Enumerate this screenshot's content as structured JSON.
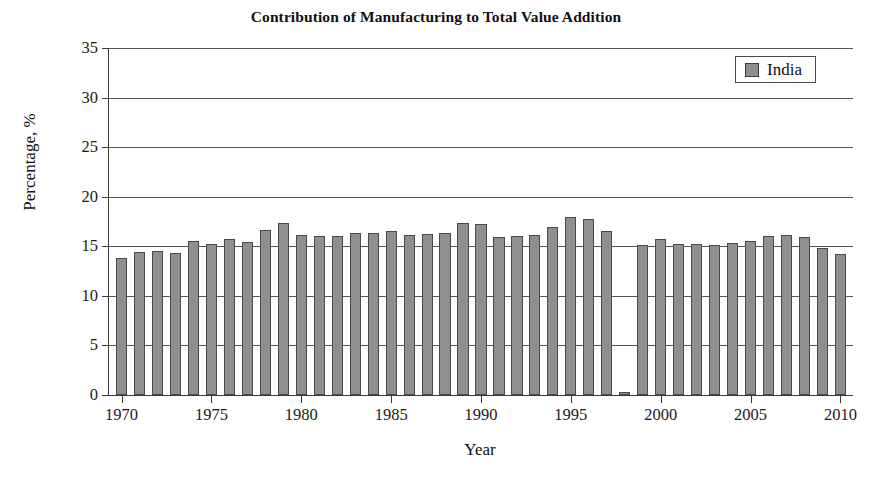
{
  "chart_data": {
    "type": "bar",
    "title": "Contribution of Manufacturing to Total Value Addition",
    "xlabel": "Year",
    "ylabel": "Percentage, %",
    "legend": [
      {
        "name": "India",
        "color": "#8f8f8f"
      }
    ],
    "legend_position": "top-right",
    "grid": true,
    "ylim": [
      0,
      35
    ],
    "yticks": [
      0,
      5,
      10,
      15,
      20,
      25,
      30,
      35
    ],
    "ytick_labels": [
      "0",
      "5",
      "10",
      "15",
      "20",
      "25",
      "30",
      "35"
    ],
    "xlim": [
      1969.3,
      2010.7
    ],
    "xticks": [
      1970,
      1975,
      1980,
      1985,
      1990,
      1995,
      2000,
      2005,
      2010
    ],
    "xtick_labels": [
      "1970",
      "1975",
      "1980",
      "1985",
      "1990",
      "1995",
      "2000",
      "2005",
      "2010"
    ],
    "categories": [
      1970,
      1971,
      1972,
      1973,
      1974,
      1975,
      1976,
      1977,
      1978,
      1979,
      1980,
      1981,
      1982,
      1983,
      1984,
      1985,
      1986,
      1987,
      1988,
      1989,
      1990,
      1991,
      1992,
      1993,
      1994,
      1995,
      1996,
      1997,
      1998,
      1999,
      2000,
      2001,
      2002,
      2003,
      2004,
      2005,
      2006,
      2007,
      2008,
      2009,
      2010
    ],
    "series": [
      {
        "name": "India",
        "color": "#8f8f8f",
        "values": [
          13.8,
          14.4,
          14.5,
          14.3,
          15.5,
          15.2,
          15.7,
          15.4,
          16.6,
          17.3,
          16.1,
          16.0,
          16.0,
          16.3,
          16.3,
          16.5,
          16.1,
          16.2,
          16.3,
          17.3,
          17.2,
          15.9,
          16.0,
          16.1,
          16.9,
          18.0,
          17.8,
          16.5,
          0.3,
          15.1,
          15.7,
          15.2,
          15.2,
          15.1,
          15.3,
          15.5,
          16.0,
          16.1,
          15.9,
          14.8,
          14.2
        ]
      }
    ]
  }
}
